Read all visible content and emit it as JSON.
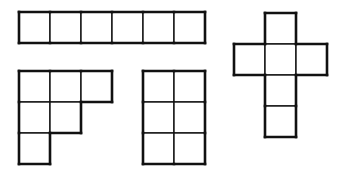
{
  "diagram": {
    "colors": {
      "stroke": "#111111",
      "fill": "#ffffff",
      "background": "#ffffff"
    },
    "cell_size": 31,
    "shapes": [
      {
        "name": "horizontal-bar",
        "origin": [
          19,
          12
        ],
        "cells": [
          [
            0,
            0
          ],
          [
            1,
            0
          ],
          [
            2,
            0
          ],
          [
            3,
            0
          ],
          [
            4,
            0
          ],
          [
            5,
            0
          ]
        ]
      },
      {
        "name": "cross",
        "origin": [
          234,
          13
        ],
        "cells": [
          [
            1,
            0
          ],
          [
            0,
            1
          ],
          [
            1,
            1
          ],
          [
            2,
            1
          ],
          [
            1,
            2
          ],
          [
            1,
            3
          ]
        ]
      },
      {
        "name": "staircase",
        "origin": [
          19,
          71
        ],
        "cells": [
          [
            0,
            0
          ],
          [
            1,
            0
          ],
          [
            2,
            0
          ],
          [
            0,
            1
          ],
          [
            1,
            1
          ],
          [
            0,
            2
          ]
        ]
      },
      {
        "name": "rectangle-2x3",
        "origin": [
          143,
          71
        ],
        "cells": [
          [
            0,
            0
          ],
          [
            1,
            0
          ],
          [
            0,
            1
          ],
          [
            1,
            1
          ],
          [
            0,
            2
          ],
          [
            1,
            2
          ]
        ]
      }
    ]
  }
}
